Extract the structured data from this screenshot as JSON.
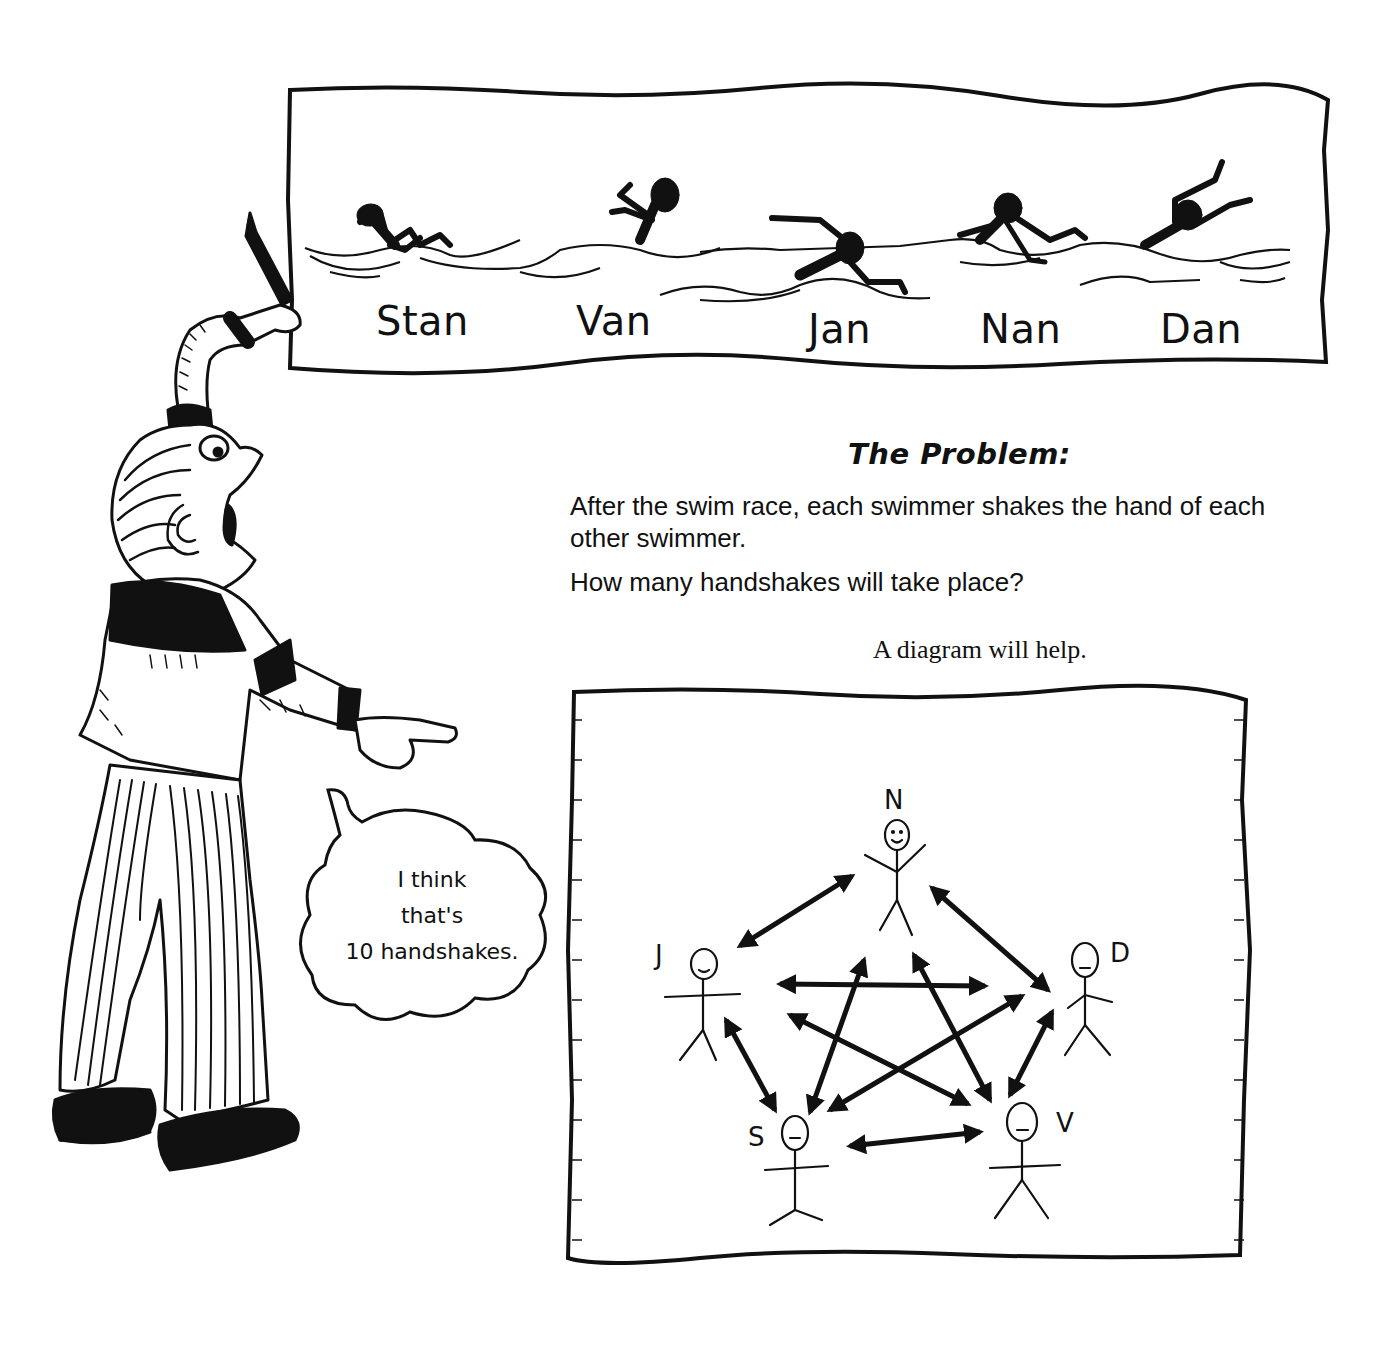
{
  "race_banner": {
    "swimmers": [
      {
        "name": "Stan",
        "label_pos": [
          376,
          300
        ]
      },
      {
        "name": "Van",
        "label_pos": [
          576,
          300
        ]
      },
      {
        "name": "Jan",
        "label_pos": [
          808,
          308
        ]
      },
      {
        "name": "Nan",
        "label_pos": [
          980,
          308
        ]
      },
      {
        "name": "Dan",
        "label_pos": [
          1160,
          308
        ]
      }
    ]
  },
  "problem": {
    "title": "The Problem:",
    "statement": "After the swim race, each swimmer shakes the hand of each other swimmer.",
    "question": "How many handshakes will take place?",
    "hint": "A diagram will help."
  },
  "speech_bubble": {
    "lines": [
      "I think",
      "that's",
      "10 handshakes."
    ]
  },
  "handshake_diagram": {
    "nodes": [
      {
        "id": "N",
        "label": "N",
        "name": "Nan"
      },
      {
        "id": "D",
        "label": "D",
        "name": "Dan"
      },
      {
        "id": "V",
        "label": "V",
        "name": "Van"
      },
      {
        "id": "S",
        "label": "S",
        "name": "Stan"
      },
      {
        "id": "J",
        "label": "J",
        "name": "Jan"
      }
    ],
    "edges": [
      [
        "N",
        "J"
      ],
      [
        "N",
        "D"
      ],
      [
        "J",
        "S"
      ],
      [
        "D",
        "V"
      ],
      [
        "S",
        "V"
      ],
      [
        "N",
        "S"
      ],
      [
        "N",
        "V"
      ],
      [
        "J",
        "D"
      ],
      [
        "J",
        "V"
      ],
      [
        "S",
        "D"
      ]
    ],
    "edge_count": 10
  }
}
